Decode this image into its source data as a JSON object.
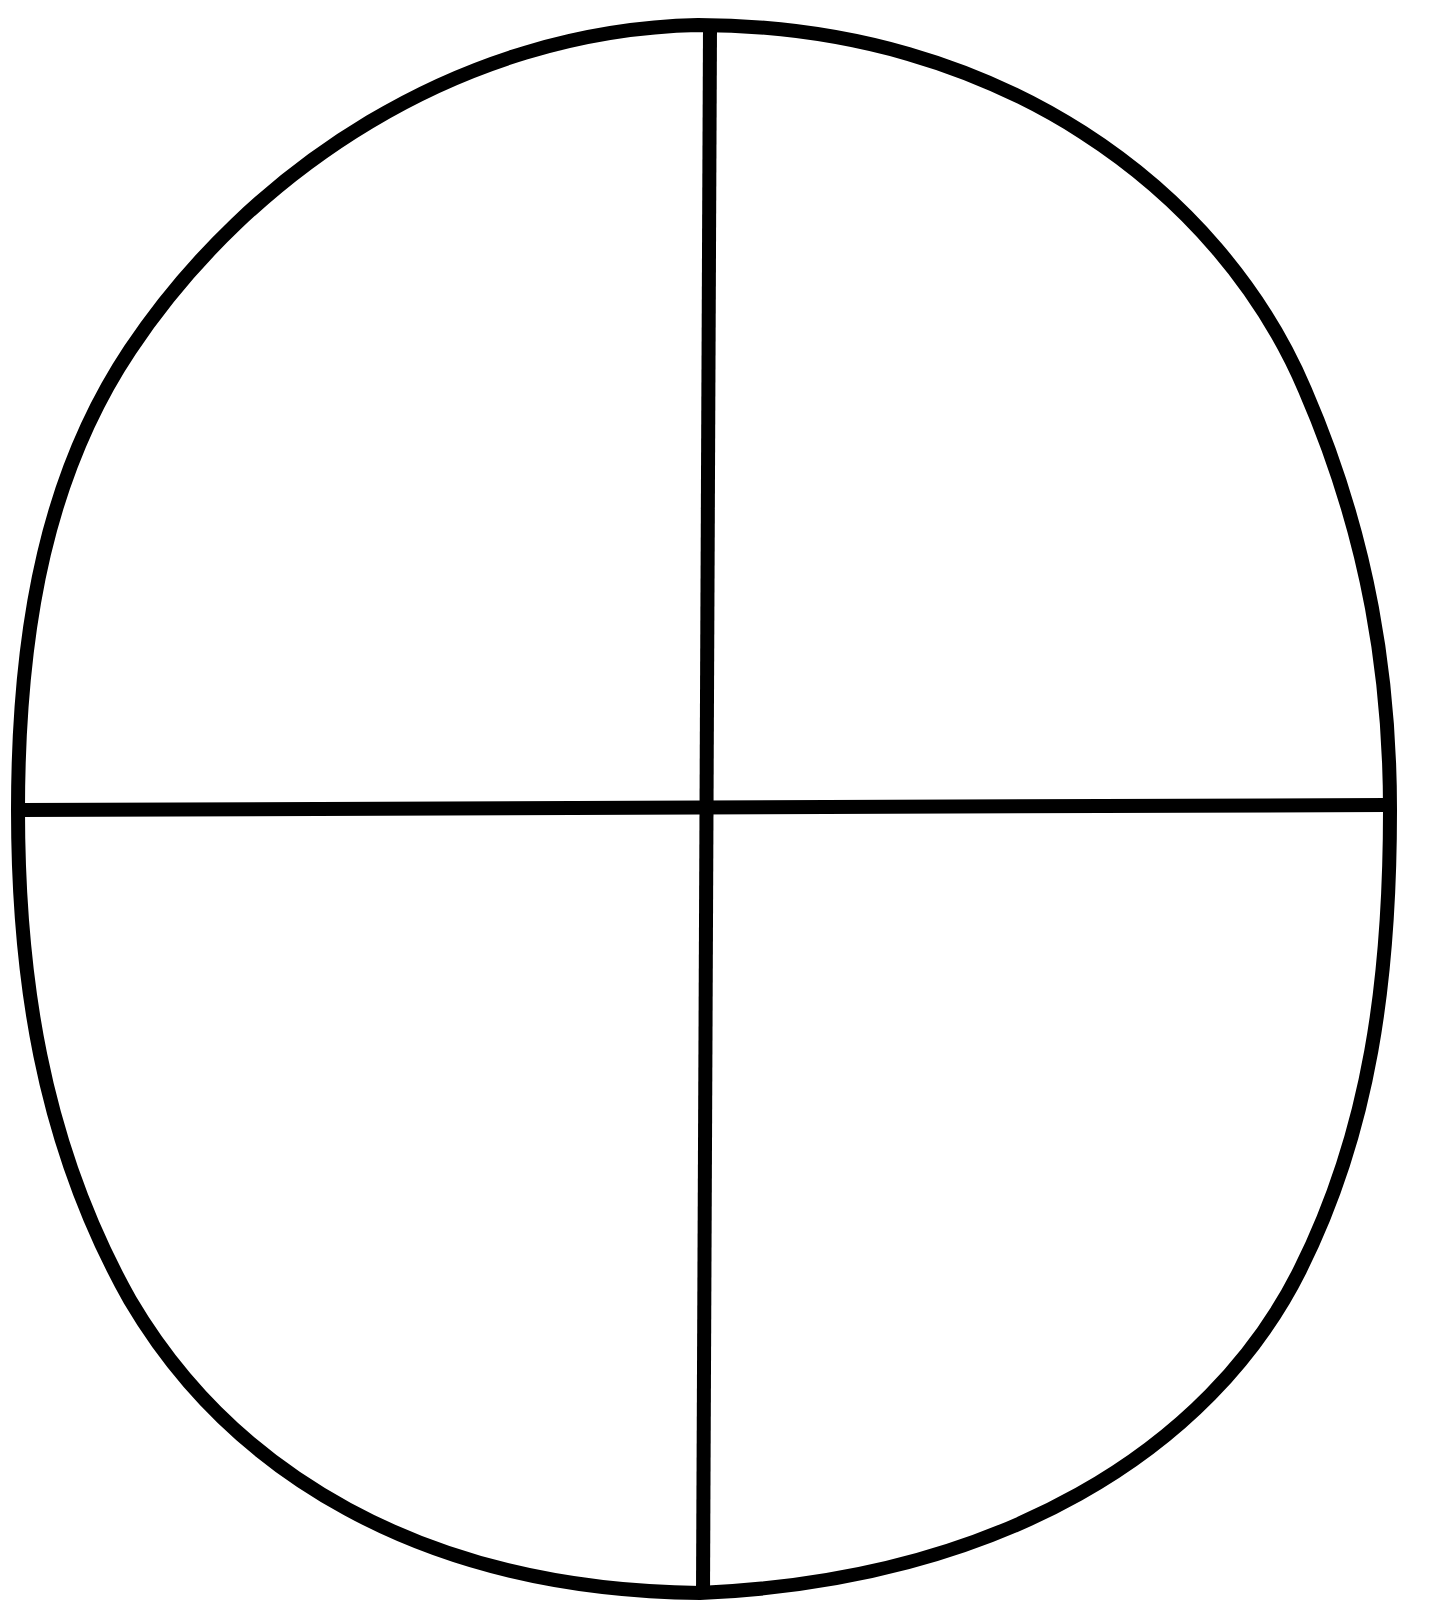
{
  "diagram": {
    "type": "quadrant-outline",
    "canvas": {
      "width": 1444,
      "height": 1601,
      "background": "#ffffff"
    },
    "stroke": {
      "color": "#000000",
      "width": 14
    },
    "outline": {
      "path": "M 698 25 C 1000 25, 1220 190, 1305 390 C 1370 540, 1390 680, 1390 810 C 1390 980, 1370 1130, 1300 1270 C 1210 1450, 1000 1580, 700 1593 C 420 1590, 230 1470, 130 1300 C 40 1140, 18 970, 18 810 C 18 620, 50 470, 130 350 C 250 170, 460 30, 698 25 Z"
    },
    "vertical_divider": {
      "x1": 710,
      "y1": 28,
      "x2": 703,
      "y2": 1593
    },
    "horizontal_divider": {
      "x1": 20,
      "y1": 810,
      "x2": 1386,
      "y2": 805
    },
    "quadrants": [
      {
        "id": "top-left",
        "label": ""
      },
      {
        "id": "top-right",
        "label": ""
      },
      {
        "id": "bottom-left",
        "label": ""
      },
      {
        "id": "bottom-right",
        "label": ""
      }
    ]
  }
}
